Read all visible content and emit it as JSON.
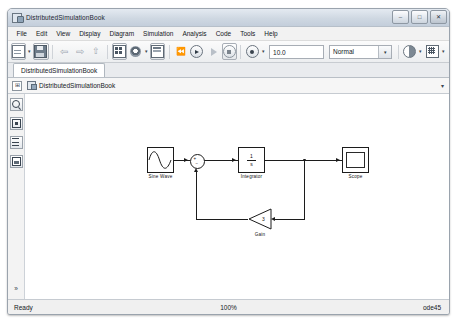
{
  "window": {
    "title": "DistributedSimulationBook",
    "app_icon": "simulink-model-icon",
    "controls": {
      "minimize": "–",
      "maximize": "□",
      "close": "✕"
    }
  },
  "menu": {
    "items": [
      {
        "label": "File"
      },
      {
        "label": "Edit"
      },
      {
        "label": "View"
      },
      {
        "label": "Display"
      },
      {
        "label": "Diagram"
      },
      {
        "label": "Simulation"
      },
      {
        "label": "Analysis"
      },
      {
        "label": "Code"
      },
      {
        "label": "Tools"
      },
      {
        "label": "Help"
      }
    ]
  },
  "toolbar": {
    "new_model": "new-model-icon",
    "new_dropdown": "▾",
    "save": "save-icon",
    "back": "⇦",
    "forward": "⇨",
    "up": "⇧",
    "library_browser": "library-browser-icon",
    "model_settings": "model-configuration-gear-icon",
    "settings_dropdown": "▾",
    "model_explorer": "model-explorer-icon",
    "rewind": "⏪",
    "run": "run-icon",
    "fast_restart": "fast-restart-icon",
    "stop": "stop-icon",
    "step_forward": "step-forward-icon",
    "step_dropdown": "▾",
    "simulation_time": "10.0",
    "simulation_mode": "Normal",
    "simulation_mode_caret": "▾",
    "performance": "performance-advisor-icon",
    "performance_dropdown": "▾",
    "model_advisor": "model-advisor-icon",
    "advisor_dropdown": "▾"
  },
  "tabs": [
    {
      "label": "DistributedSimulationBook",
      "active": true
    }
  ],
  "breadcrumb": {
    "expand_glyph": "⊞",
    "icon": "model-hierarchy-icon",
    "path": "DistributedSimulationBook",
    "caret": "▾"
  },
  "sidebar": {
    "items": [
      {
        "name": "zoom-tool",
        "icon": "magnifier-icon"
      },
      {
        "name": "fit-to-view-tool",
        "icon": "fit-to-view-icon"
      },
      {
        "name": "fit-width-tool",
        "icon": "fit-width-icon"
      },
      {
        "name": "model-browser-tool",
        "icon": "image-icon"
      }
    ],
    "more_glyph": "»"
  },
  "model": {
    "blocks": [
      {
        "id": "sine",
        "type": "SineWave",
        "label": "Sine Wave"
      },
      {
        "id": "sum",
        "type": "Sum",
        "label": "",
        "signs": [
          "+",
          "−"
        ]
      },
      {
        "id": "integrator",
        "type": "Integrator",
        "label": "Integrator",
        "numerator": "1",
        "denominator": "s"
      },
      {
        "id": "scope",
        "type": "Scope",
        "label": "Scope"
      },
      {
        "id": "gain",
        "type": "Gain",
        "label": "Gain",
        "value": "3"
      }
    ]
  },
  "status": {
    "message": "Ready",
    "zoom": "100%",
    "solver": "ode45"
  }
}
